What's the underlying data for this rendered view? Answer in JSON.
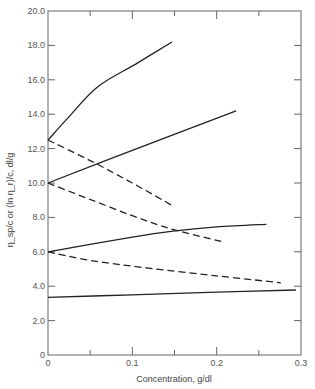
{
  "chart_data": {
    "type": "line",
    "title": "",
    "xlabel": "Concentration, g/dl",
    "ylabel": "η_sp/c or (ln η_r)/c, dl/g",
    "xlim": [
      0,
      0.3
    ],
    "ylim": [
      0,
      20
    ],
    "x_ticks": [
      {
        "value": 0,
        "label": "0"
      },
      {
        "value": 0.1,
        "label": "0.1"
      },
      {
        "value": 0.2,
        "label": "0.2"
      },
      {
        "value": 0.3,
        "label": "0.3"
      }
    ],
    "x_minor_ticks": [
      0.05,
      0.15,
      0.25
    ],
    "y_ticks": [
      {
        "value": 0,
        "label": "0"
      },
      {
        "value": 2,
        "label": "2.0"
      },
      {
        "value": 4,
        "label": "4.0"
      },
      {
        "value": 6,
        "label": "6.0"
      },
      {
        "value": 8,
        "label": "8.0"
      },
      {
        "value": 10,
        "label": "10.0"
      },
      {
        "value": 12,
        "label": "12.0"
      },
      {
        "value": 14,
        "label": "14.0"
      },
      {
        "value": 16,
        "label": "16.0"
      },
      {
        "value": 18,
        "label": "18.0"
      },
      {
        "value": 20,
        "label": "20.0"
      }
    ],
    "grid": false,
    "legend": null,
    "series": [
      {
        "name": "η_sp/c (intercept 12.5)",
        "style": "solid",
        "x": [
          0,
          0.024,
          0.059,
          0.107,
          0.147
        ],
        "y": [
          12.5,
          13.8,
          15.6,
          17.0,
          18.2
        ]
      },
      {
        "name": "(ln η_r)/c (intercept 12.5)",
        "style": "dashed",
        "x": [
          0,
          0.05,
          0.1,
          0.147
        ],
        "y": [
          12.5,
          11.3,
          10.0,
          8.7
        ]
      },
      {
        "name": "η_sp/c (intercept 10.0)",
        "style": "solid",
        "x": [
          0,
          0.1,
          0.223
        ],
        "y": [
          10.0,
          11.9,
          14.2
        ]
      },
      {
        "name": "(ln η_r)/c (intercept 10.0)",
        "style": "dashed",
        "x": [
          0,
          0.047,
          0.1,
          0.148,
          0.206
        ],
        "y": [
          10.0,
          9.1,
          8.1,
          7.3,
          6.6
        ]
      },
      {
        "name": "η_sp/c (intercept 6.0)",
        "style": "solid",
        "x": [
          0,
          0.1,
          0.148,
          0.2,
          0.259
        ],
        "y": [
          6.0,
          6.85,
          7.2,
          7.45,
          7.6
        ]
      },
      {
        "name": "(ln η_r)/c (intercept 6.0)",
        "style": "dashed",
        "x": [
          0,
          0.05,
          0.119,
          0.2,
          0.276
        ],
        "y": [
          6.0,
          5.5,
          5.05,
          4.6,
          4.2
        ]
      },
      {
        "name": "η_sp/c ≈ (ln η_r)/c (intercept 3.35)",
        "style": "solid",
        "x": [
          0,
          0.1,
          0.2,
          0.294
        ],
        "y": [
          3.35,
          3.5,
          3.65,
          3.78
        ]
      }
    ]
  }
}
